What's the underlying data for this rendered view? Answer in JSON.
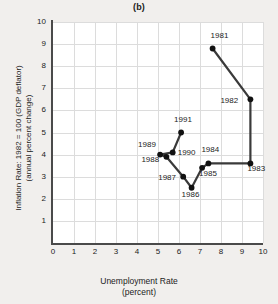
{
  "chart_data": {
    "type": "line",
    "title": "(b)",
    "xlabel": "Unemployment Rate",
    "xlabel_sub": "(percent)",
    "ylabel": "Inflation Rate: 1982 = 100 (GDP deflator)",
    "ylabel_sub": "(annual percent change)",
    "xlim": [
      0,
      10
    ],
    "ylim": [
      0,
      10
    ],
    "xticks": [
      0,
      1,
      2,
      3,
      4,
      5,
      6,
      7,
      8,
      9,
      10
    ],
    "yticks": [
      1,
      2,
      3,
      4,
      5,
      6,
      7,
      8,
      9,
      10
    ],
    "grid": true,
    "legend": "none",
    "series": [
      {
        "name": "Phillips curve path 1981-1991",
        "points": [
          {
            "label": "1981",
            "x": 7.6,
            "y": 8.8,
            "label_dx": -2,
            "label_dy": -13
          },
          {
            "label": "1982",
            "x": 9.4,
            "y": 6.5,
            "label_dx": -30,
            "label_dy": 2
          },
          {
            "label": "1983",
            "x": 9.4,
            "y": 3.6,
            "label_dx": -3,
            "label_dy": 6
          },
          {
            "label": "1984",
            "x": 7.4,
            "y": 3.6,
            "label_dx": -7,
            "label_dy": -13
          },
          {
            "label": "1985",
            "x": 7.1,
            "y": 3.4,
            "label_dx": -3,
            "label_dy": 6
          },
          {
            "label": "1986",
            "x": 6.6,
            "y": 2.5,
            "label_dx": -10,
            "label_dy": 7
          },
          {
            "label": "1987",
            "x": 6.2,
            "y": 3.0,
            "label_dx": -25,
            "label_dy": 1
          },
          {
            "label": "1988",
            "x": 5.4,
            "y": 3.9,
            "label_dx": -25,
            "label_dy": 3
          },
          {
            "label": "1989",
            "x": 5.1,
            "y": 4.0,
            "label_dx": -22,
            "label_dy": -10
          },
          {
            "label": "1990",
            "x": 5.7,
            "y": 4.1,
            "label_dx": 5,
            "label_dy": 1
          },
          {
            "label": "1991",
            "x": 6.1,
            "y": 5.0,
            "label_dx": -7,
            "label_dy": -13
          }
        ]
      }
    ],
    "line_color": "#3a3a3a",
    "marker_color": "#111111",
    "grid_color": "#dcdcdc",
    "axis_color": "#4a4a4a",
    "plot_bg": "#ffffff",
    "page_bg": "#f1efed"
  }
}
